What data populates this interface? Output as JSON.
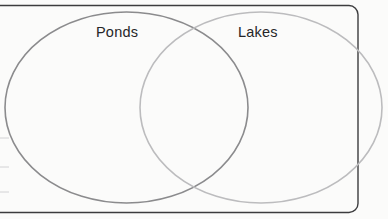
{
  "diagram": {
    "type": "venn-diagram",
    "set_count": 2,
    "background_color": "#fbfbfa",
    "frame": {
      "name": "worksheet-frame",
      "border_color": "#3c3c3e",
      "border_width": 1.4,
      "corner_radius": 9,
      "x": -40,
      "y": 5.5,
      "width": 398,
      "height": 207
    },
    "sets": [
      {
        "name": "Ponds",
        "label": "Ponds",
        "position": "left",
        "stroke_color": "#8b8b8d",
        "stroke_width": 1.6,
        "fill": "none",
        "cx": 126.5,
        "cy": 107.5,
        "rx": 121.5,
        "ry": 95.5,
        "label_x": 96,
        "label_y": 25
      },
      {
        "name": "Lakes",
        "label": "Lakes",
        "position": "right",
        "stroke_color": "#bcbcbe",
        "stroke_width": 1.6,
        "fill": "none",
        "cx": 261,
        "cy": 107.5,
        "rx": 121,
        "ry": 95.5,
        "label_x": 238,
        "label_y": 25
      }
    ],
    "intersection": {
      "name": "overlap-region",
      "label": "",
      "upper_crossing": {
        "x": 196,
        "y": 28
      },
      "lower_crossing": {
        "x": 193,
        "y": 192
      }
    },
    "label_color": "#262628",
    "label_font_size": 14.5,
    "scan_marks": [
      {
        "x": 0,
        "y": 138,
        "width": 9,
        "color": "#d2d2d4"
      },
      {
        "x": 0,
        "y": 167,
        "width": 9,
        "color": "#d2d2d4"
      },
      {
        "x": 0,
        "y": 192,
        "width": 9,
        "color": "#d2d2d4"
      }
    ]
  }
}
